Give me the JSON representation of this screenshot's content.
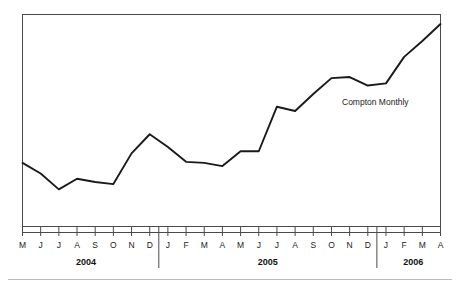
{
  "chart_data": {
    "type": "line",
    "title": "",
    "subtitle": "",
    "xlabel": "",
    "ylabel": "",
    "grid": false,
    "legend_position": "inline-annotation",
    "annotations": [
      {
        "text": "Compton Monthly",
        "x": "2005-11",
        "y": 0.565
      }
    ],
    "axis": {
      "x_range": [
        "2004-05",
        "2006-04"
      ],
      "y_visible_ticks": false,
      "y_axis_labels": []
    },
    "categories": [
      "M",
      "J",
      "J",
      "A",
      "S",
      "O",
      "N",
      "D",
      "J",
      "F",
      "M",
      "A",
      "M",
      "J",
      "J",
      "A",
      "S",
      "O",
      "N",
      "D",
      "J",
      "F",
      "M",
      "A"
    ],
    "category_months": [
      "2004-05",
      "2004-06",
      "2004-07",
      "2004-08",
      "2004-09",
      "2004-10",
      "2004-11",
      "2004-12",
      "2005-01",
      "2005-02",
      "2005-03",
      "2005-04",
      "2005-05",
      "2005-06",
      "2005-07",
      "2005-08",
      "2005-09",
      "2005-10",
      "2005-11",
      "2005-12",
      "2006-01",
      "2006-02",
      "2006-03",
      "2006-04"
    ],
    "year_groups": [
      {
        "label": "2004",
        "start_index": 0,
        "end_index": 7
      },
      {
        "label": "2005",
        "start_index": 8,
        "end_index": 19
      },
      {
        "label": "2006",
        "start_index": 20,
        "end_index": 23
      }
    ],
    "series": [
      {
        "name": "Compton Monthly",
        "color": "#1a1a1a",
        "values": [
          0.3,
          0.25,
          0.175,
          0.225,
          0.21,
          0.2,
          0.345,
          0.435,
          0.375,
          0.305,
          0.3,
          0.285,
          0.355,
          0.355,
          0.565,
          0.545,
          0.625,
          0.7,
          0.705,
          0.665,
          0.675,
          0.8,
          0.875,
          0.955
        ]
      }
    ],
    "ylim": [
      0,
      1
    ]
  },
  "figure": {
    "annotation_label": "Compton Monthly",
    "footer_rule": true
  }
}
